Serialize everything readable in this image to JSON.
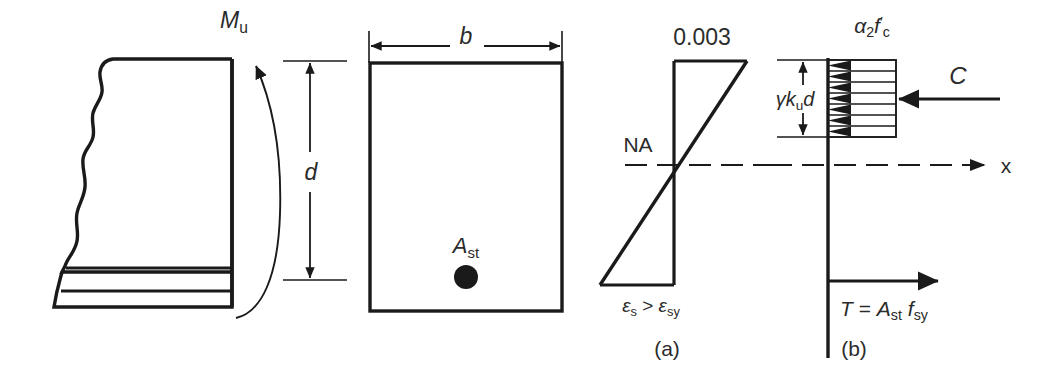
{
  "figure": {
    "background_color": "#ffffff",
    "line_color": "#1a1a1a",
    "text_color": "#2b2b2b"
  },
  "beam_elevation": {
    "moment_label": "M",
    "moment_sub": "u",
    "depth_label": "d"
  },
  "cross_section": {
    "width_label": "b",
    "steel_area_label": "A",
    "steel_area_sub": "st"
  },
  "strain_diagram": {
    "caption": "(a)",
    "top_strain": "0.003",
    "neutral_axis_label": "NA",
    "steel_strain_eps": "ε",
    "steel_strain_sub": "s",
    "steel_strain_rel": ">",
    "yield_strain_eps": "ε",
    "yield_strain_sub": "sy"
  },
  "stress_diagram": {
    "caption": "(b)",
    "stress_alpha": "α",
    "stress_alpha_sub": "2",
    "stress_f": "f",
    "stress_f_sub": "c",
    "stress_f_prime": "′",
    "depth_gamma": "γ",
    "depth_k": "k",
    "depth_k_sub": "u",
    "depth_d": "d",
    "compression_label": "C",
    "axis_label": "x",
    "tension_T": "T",
    "tension_eq": "=",
    "tension_A": "A",
    "tension_A_sub": "st",
    "tension_f": "f",
    "tension_f_sub": "sy"
  }
}
